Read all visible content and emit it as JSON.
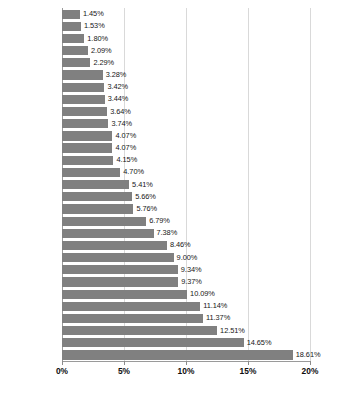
{
  "chart_data": {
    "type": "bar",
    "orientation": "horizontal",
    "title": "",
    "subtitle": "",
    "xlabel": "",
    "ylabel": "",
    "xlim": [
      0,
      20
    ],
    "xticks": [
      0,
      5,
      10,
      15,
      20
    ],
    "xtick_labels": [
      "0%",
      "5%",
      "10%",
      "15%",
      "20%"
    ],
    "grid": true,
    "grid_axis": "x",
    "legend": false,
    "legend_position": "none",
    "value_label_suffix": "%",
    "categories": [
      "Norway",
      "Nigeria",
      "Sweden",
      "Argentina",
      "New Zealand",
      "Denmark",
      "South Africa",
      "Brazil",
      "Chile",
      "Canada",
      "Indonesia",
      "UK",
      "Australia",
      "Turkey",
      "Korea",
      "Israel",
      "Mexico",
      "Colombia",
      "US",
      "Singapore",
      "Russia",
      "China",
      "Taiwan",
      "Eurozone",
      "Switzerland",
      "Thailand",
      "India",
      "Hong Kong",
      "Japan"
    ],
    "values": [
      1.45,
      1.53,
      1.8,
      2.09,
      2.29,
      3.28,
      3.42,
      3.44,
      3.64,
      3.74,
      4.07,
      4.07,
      4.15,
      4.7,
      5.41,
      5.66,
      5.76,
      6.79,
      7.38,
      8.46,
      9.0,
      9.34,
      9.37,
      10.09,
      11.14,
      11.37,
      12.51,
      14.65,
      18.61
    ],
    "value_labels": [
      "1.45%",
      "1.53%",
      "1.80%",
      "2.09%",
      "2.29%",
      "3.28%",
      "3.42%",
      "3.44%",
      "3.64%",
      "3.74%",
      "4.07%",
      "4.07%",
      "4.15%",
      "4.70%",
      "5.41%",
      "5.66%",
      "5.76%",
      "6.79%",
      "7.38%",
      "8.46%",
      "9.00%",
      "9.34%",
      "9.37%",
      "10.09%",
      "11.14%",
      "11.37%",
      "12.51%",
      "14.65%",
      "18.61%"
    ],
    "bar_color": "#808080",
    "gridline_color": "#d9d9d9",
    "axis_color": "#9a9a9a",
    "text_color": "#101010"
  },
  "caption": {
    "text": ""
  }
}
